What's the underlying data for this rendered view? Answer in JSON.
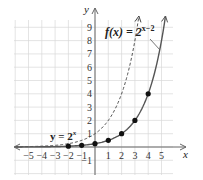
{
  "chart_data": {
    "type": "line",
    "title": "",
    "xlabel": "x",
    "ylabel": "y",
    "xlim": [
      -6,
      6
    ],
    "ylim": [
      -2,
      10
    ],
    "grid": true,
    "x_ticks": [
      "-5",
      "-4",
      "-3",
      "-2",
      "-1",
      "1",
      "2",
      "3",
      "4",
      "5"
    ],
    "x_tick_values": [
      -5,
      -4,
      -3,
      -2,
      -1,
      1,
      2,
      3,
      4,
      5
    ],
    "y_ticks": [
      "-1",
      "1",
      "2",
      "3",
      "4",
      "5",
      "6",
      "7",
      "8",
      "9"
    ],
    "y_tick_values": [
      -1,
      1,
      2,
      3,
      4,
      5,
      6,
      7,
      8,
      9
    ],
    "series": [
      {
        "name": "y = 2^x",
        "label_main": "y = 2",
        "label_sup": "x",
        "style": "dashed",
        "function": "2^x",
        "x_range": [
          -6,
          3.3
        ]
      },
      {
        "name": "f(x) = 2^(x-2)",
        "label_main": "f(x) = 2",
        "label_sup": "x−2",
        "style": "solid",
        "function": "2^(x-2)",
        "x_range": [
          -6,
          5.3
        ],
        "points": [
          {
            "x": -2,
            "y": 0.0625
          },
          {
            "x": -1,
            "y": 0.125
          },
          {
            "x": 0,
            "y": 0.25
          },
          {
            "x": 1,
            "y": 0.5
          },
          {
            "x": 2,
            "y": 1
          },
          {
            "x": 3,
            "y": 2
          },
          {
            "x": 4,
            "y": 4
          }
        ]
      }
    ],
    "colors": {
      "grid": "#d8d8d8",
      "axis": "#666666",
      "solid_curve": "#555555",
      "dashed_curve": "#444444",
      "points": "#111111"
    }
  }
}
